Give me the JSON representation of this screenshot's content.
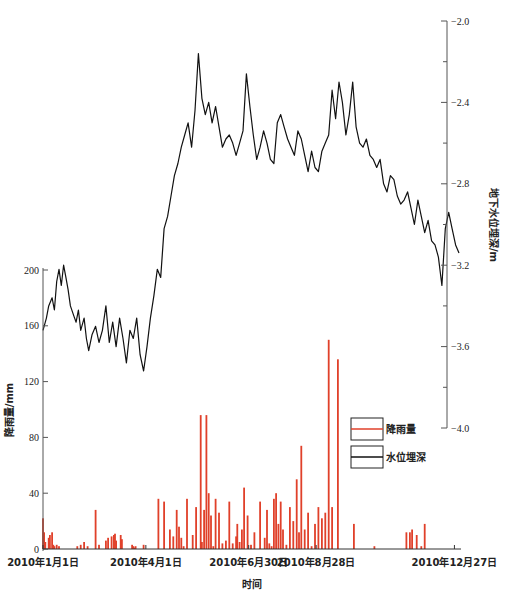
{
  "chart_data": {
    "type": "line+bar",
    "title": "",
    "xlabel": "时间",
    "x_ticks": [
      "2010年1月1日",
      "2010年4月1日",
      "2010年6月30日",
      "2010年8月28日",
      "2010年12月27日"
    ],
    "x_tick_days": [
      0,
      90,
      180,
      239,
      360
    ],
    "x_range_days": [
      0,
      364
    ],
    "left_axis": {
      "label": "降雨量/mm",
      "ylim": [
        0,
        200
      ],
      "ticks": [
        0,
        40,
        80,
        120,
        160,
        200
      ]
    },
    "right_axis": {
      "label": "地下水位埋深/m",
      "ylim": [
        -4.0,
        -2.0
      ],
      "ticks": [
        -2.0,
        -2.4,
        -2.8,
        -3.2,
        -3.6,
        -4.0
      ],
      "tick_labels": [
        "-2.0",
        "-2.4",
        "-2.8",
        "-3.2",
        "-3.6",
        "-4.0"
      ]
    },
    "legend": {
      "position": "center-right",
      "entries": [
        {
          "name": "降雨量",
          "color": "#e0402a"
        },
        {
          "name": "水位埋深",
          "color": "#111111"
        }
      ]
    },
    "grid": false,
    "series": [
      {
        "name": "降雨量",
        "type": "bar",
        "axis": "left",
        "color": "#e0402a",
        "unit": "mm",
        "day": [
          0,
          1,
          2,
          5,
          6,
          8,
          9,
          10,
          12,
          14,
          30,
          33,
          36,
          39,
          46,
          49,
          55,
          57,
          60,
          62,
          63,
          64,
          68,
          69,
          78,
          79,
          80,
          81,
          88,
          101,
          106,
          111,
          114,
          117,
          119,
          121,
          123,
          126,
          131,
          134,
          138,
          139,
          141,
          143,
          145,
          147,
          149,
          151,
          154,
          157,
          160,
          163,
          166,
          169,
          170,
          172,
          174,
          176,
          179,
          182,
          185,
          190,
          194,
          196,
          198,
          200,
          202,
          204,
          206,
          208,
          210,
          213,
          216,
          219,
          222,
          224,
          226,
          229,
          232,
          235,
          238,
          241,
          244,
          247,
          250,
          253,
          258,
          272,
          290,
          318,
          321,
          323,
          327,
          331,
          334
        ],
        "values": [
          22,
          12,
          5,
          8,
          10,
          12,
          3,
          2,
          3,
          2,
          2,
          3,
          5,
          2,
          28,
          3,
          6,
          8,
          9,
          10,
          11,
          6,
          10,
          7,
          3,
          2,
          1,
          2,
          3,
          36,
          34,
          14,
          9,
          28,
          16,
          8,
          2,
          36,
          10,
          30,
          96,
          5,
          28,
          96,
          40,
          24,
          2,
          36,
          26,
          4,
          6,
          34,
          4,
          9,
          18,
          5,
          14,
          44,
          24,
          3,
          12,
          34,
          8,
          28,
          4,
          2,
          36,
          40,
          18,
          34,
          14,
          3,
          30,
          20,
          50,
          12,
          74,
          14,
          26,
          2,
          18,
          30,
          22,
          26,
          150,
          30,
          136,
          18,
          2,
          12,
          12,
          14,
          10,
          2,
          18,
          10,
          8,
          7,
          3,
          6,
          2,
          1,
          6,
          4,
          24,
          4,
          8,
          4,
          3,
          4
        ]
      },
      {
        "name": "水位埋深",
        "type": "line",
        "axis": "right",
        "color": "#111111",
        "unit": "m",
        "day": [
          0,
          3,
          5,
          8,
          10,
          12,
          14,
          16,
          18,
          20,
          22,
          24,
          27,
          29,
          31,
          33,
          36,
          38,
          40,
          43,
          46,
          49,
          52,
          55,
          58,
          61,
          64,
          67,
          70,
          73,
          76,
          79,
          82,
          85,
          88,
          91,
          94,
          97,
          100,
          103,
          106,
          109,
          112,
          115,
          118,
          121,
          124,
          127,
          130,
          133,
          136,
          139,
          142,
          145,
          148,
          151,
          154,
          157,
          160,
          163,
          166,
          169,
          172,
          175,
          178,
          181,
          184,
          187,
          190,
          193,
          196,
          199,
          202,
          205,
          208,
          211,
          214,
          217,
          220,
          223,
          226,
          229,
          232,
          235,
          238,
          241,
          244,
          247,
          250,
          253,
          256,
          259,
          262,
          265,
          268,
          271,
          274,
          277,
          280,
          283,
          286,
          289,
          292,
          295,
          298,
          301,
          304,
          307,
          310,
          313,
          316,
          319,
          322,
          325,
          328,
          331,
          334,
          337,
          340,
          343,
          346,
          349,
          352,
          355,
          358,
          361,
          364
        ],
        "values": [
          -3.52,
          -3.46,
          -3.4,
          -3.36,
          -3.42,
          -3.28,
          -3.22,
          -3.3,
          -3.2,
          -3.26,
          -3.32,
          -3.4,
          -3.45,
          -3.48,
          -3.42,
          -3.52,
          -3.46,
          -3.56,
          -3.62,
          -3.54,
          -3.5,
          -3.58,
          -3.52,
          -3.4,
          -3.58,
          -3.48,
          -3.6,
          -3.46,
          -3.56,
          -3.68,
          -3.52,
          -3.56,
          -3.46,
          -3.64,
          -3.72,
          -3.6,
          -3.46,
          -3.35,
          -3.22,
          -3.26,
          -3.02,
          -2.96,
          -2.86,
          -2.76,
          -2.7,
          -2.62,
          -2.56,
          -2.5,
          -2.62,
          -2.44,
          -2.16,
          -2.38,
          -2.46,
          -2.4,
          -2.5,
          -2.42,
          -2.52,
          -2.62,
          -2.58,
          -2.56,
          -2.6,
          -2.66,
          -2.6,
          -2.54,
          -2.26,
          -2.42,
          -2.56,
          -2.68,
          -2.62,
          -2.54,
          -2.6,
          -2.68,
          -2.7,
          -2.5,
          -2.46,
          -2.52,
          -2.58,
          -2.62,
          -2.66,
          -2.54,
          -2.58,
          -2.66,
          -2.74,
          -2.64,
          -2.72,
          -2.74,
          -2.64,
          -2.6,
          -2.56,
          -2.34,
          -2.48,
          -2.3,
          -2.4,
          -2.56,
          -2.46,
          -2.3,
          -2.52,
          -2.6,
          -2.62,
          -2.58,
          -2.66,
          -2.68,
          -2.72,
          -2.68,
          -2.8,
          -2.84,
          -2.76,
          -2.78,
          -2.86,
          -2.9,
          -2.88,
          -2.84,
          -2.92,
          -3.0,
          -2.88,
          -2.96,
          -3.04,
          -2.98,
          -3.08,
          -3.1,
          -3.16,
          -3.3,
          -3.02,
          -2.94,
          -3.02,
          -3.1,
          -3.14
        ]
      }
    ]
  }
}
